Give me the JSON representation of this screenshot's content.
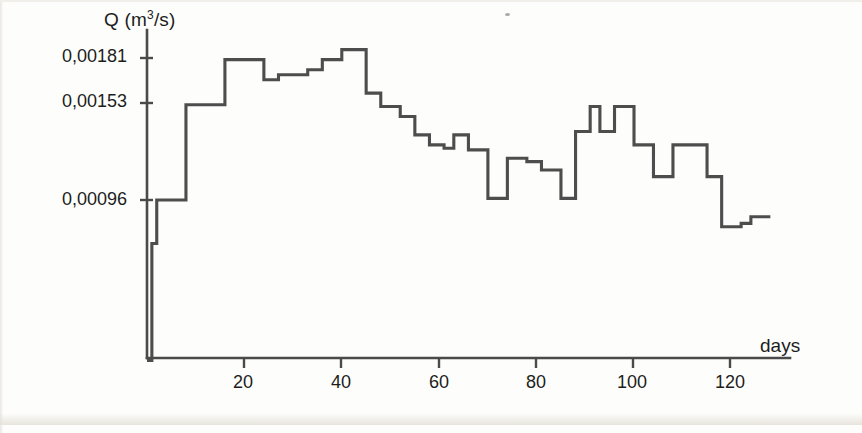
{
  "chart_data": {
    "type": "line",
    "title": "",
    "subtitle": "",
    "xlabel": "days",
    "ylabel": "Q (m3/s)",
    "ylabel_display": "Q (m³/s)",
    "units": "m³/s",
    "grid": false,
    "legend": null,
    "legend_position": "none",
    "xlim": [
      0,
      128
    ],
    "ylim": [
      0,
      0.00192
    ],
    "xticks": [
      20,
      40,
      60,
      80,
      100,
      120
    ],
    "xtick_labels": [
      "20",
      "40",
      "60",
      "80",
      "100",
      "120"
    ],
    "yticks": [
      0.00096,
      0.00153,
      0.00181
    ],
    "ytick_labels": [
      "0,00096",
      "0,00153",
      "0,00181"
    ],
    "decimal_separator": ",",
    "line_color": "#4d4d4d",
    "axis_color": "#4a4a4a",
    "background_color": "#fdfdfb",
    "series": [
      {
        "name": "Q",
        "step_style": "post",
        "x": [
          0,
          1,
          2,
          4,
          5,
          6,
          8,
          9,
          10,
          12,
          13,
          14,
          16,
          17,
          18,
          20,
          22,
          24,
          25,
          26,
          27,
          28,
          29,
          30,
          31,
          32,
          33,
          34,
          35,
          36,
          37,
          38,
          40,
          41,
          42,
          44,
          45,
          46,
          48,
          49,
          50,
          52,
          53,
          54,
          55,
          56,
          57,
          58,
          59,
          60,
          61,
          62,
          63,
          64,
          65,
          66,
          67,
          68,
          69,
          70,
          71,
          72,
          73,
          74,
          75,
          76,
          77,
          78,
          79,
          80,
          81,
          82,
          83,
          84,
          85,
          86,
          87,
          88,
          89,
          90,
          91,
          92,
          93,
          94,
          95,
          96,
          97,
          98,
          99,
          100,
          101,
          102,
          103,
          104,
          105,
          106,
          107,
          108,
          109,
          110,
          111,
          112,
          113,
          114,
          115,
          116,
          117,
          118,
          119,
          120,
          122,
          124,
          126,
          128
        ],
        "y": [
          0.0,
          0.0007,
          0.00096,
          0.00096,
          0.00096,
          0.00096,
          0.00153,
          0.00153,
          0.00153,
          0.00153,
          0.00153,
          0.00153,
          0.0018,
          0.0018,
          0.0018,
          0.0018,
          0.0018,
          0.00168,
          0.00168,
          0.00168,
          0.00171,
          0.00171,
          0.00171,
          0.00171,
          0.00171,
          0.00171,
          0.00174,
          0.00174,
          0.00174,
          0.0018,
          0.0018,
          0.0018,
          0.00186,
          0.00186,
          0.00186,
          0.00186,
          0.0016,
          0.0016,
          0.00152,
          0.00152,
          0.00152,
          0.00146,
          0.00146,
          0.00146,
          0.00135,
          0.00135,
          0.00135,
          0.00129,
          0.00129,
          0.00129,
          0.00127,
          0.00127,
          0.00135,
          0.00135,
          0.00135,
          0.00126,
          0.00126,
          0.00126,
          0.00126,
          0.00097,
          0.00097,
          0.00097,
          0.00097,
          0.00121,
          0.00121,
          0.00121,
          0.00121,
          0.00119,
          0.00119,
          0.00119,
          0.00114,
          0.00114,
          0.00114,
          0.00114,
          0.00097,
          0.00097,
          0.00097,
          0.00137,
          0.00137,
          0.00137,
          0.00152,
          0.00152,
          0.00137,
          0.00137,
          0.00137,
          0.00152,
          0.00152,
          0.00152,
          0.00152,
          0.00129,
          0.00129,
          0.00129,
          0.00129,
          0.0011,
          0.0011,
          0.0011,
          0.0011,
          0.00129,
          0.00129,
          0.00129,
          0.00129,
          0.00129,
          0.00129,
          0.00129,
          0.0011,
          0.0011,
          0.0011,
          0.0008,
          0.0008,
          0.0008,
          0.00082,
          0.00086,
          0.00086,
          0.00086
        ]
      }
    ],
    "pixel_mapping": {
      "x_origin_px": 147,
      "x_px_per_day": 4.87,
      "y_ref1": {
        "value": 0.00181,
        "px": 58
      },
      "y_ref2": {
        "value": 0.00096,
        "px": 200
      }
    }
  },
  "axis": {
    "y_title": "Q (m³/s)",
    "y_title_base": "Q (m",
    "y_title_sup": "3",
    "y_title_tail": "/s)",
    "x_title": "days",
    "ytick_labels": [
      "0,00181",
      "0,00153",
      "0,00096"
    ],
    "xtick_labels": [
      "20",
      "40",
      "60",
      "80",
      "100",
      "120"
    ]
  }
}
